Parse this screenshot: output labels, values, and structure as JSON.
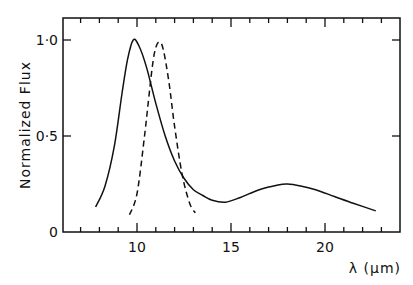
{
  "chart_data": {
    "type": "line",
    "title": "",
    "xlabel": "λ (μm)",
    "ylabel": "Normalized Flux",
    "xlim": [
      6,
      24
    ],
    "ylim": [
      0,
      1.1
    ],
    "x_ticks": [
      10,
      15,
      20
    ],
    "x_tick_labels": [
      "10",
      "15",
      "20"
    ],
    "x_minor_step": 1,
    "y_ticks": [
      0,
      0.5,
      1.0
    ],
    "y_tick_labels": [
      "0",
      "0·5",
      "1·0"
    ],
    "grid": false,
    "legend": null,
    "series": [
      {
        "name": "solid",
        "style": "solid",
        "x": [
          7.8,
          8.3,
          8.8,
          9.2,
          9.5,
          9.8,
          10.1,
          10.5,
          11.0,
          11.5,
          12.0,
          12.5,
          13.0,
          13.5,
          14.0,
          14.7,
          15.5,
          16.5,
          17.5,
          18.0,
          18.7,
          19.5,
          20.5,
          21.5,
          22.7
        ],
        "y": [
          0.13,
          0.24,
          0.45,
          0.72,
          0.9,
          1.0,
          0.97,
          0.86,
          0.67,
          0.5,
          0.37,
          0.28,
          0.22,
          0.19,
          0.165,
          0.155,
          0.18,
          0.22,
          0.245,
          0.25,
          0.24,
          0.22,
          0.185,
          0.15,
          0.11
        ]
      },
      {
        "name": "dashed",
        "style": "dashed",
        "x": [
          9.6,
          10.0,
          10.4,
          10.8,
          11.0,
          11.2,
          11.4,
          11.7,
          12.0,
          12.4,
          12.8,
          13.1
        ],
        "y": [
          0.09,
          0.2,
          0.5,
          0.85,
          0.96,
          0.99,
          0.95,
          0.78,
          0.55,
          0.3,
          0.15,
          0.1
        ]
      }
    ]
  }
}
